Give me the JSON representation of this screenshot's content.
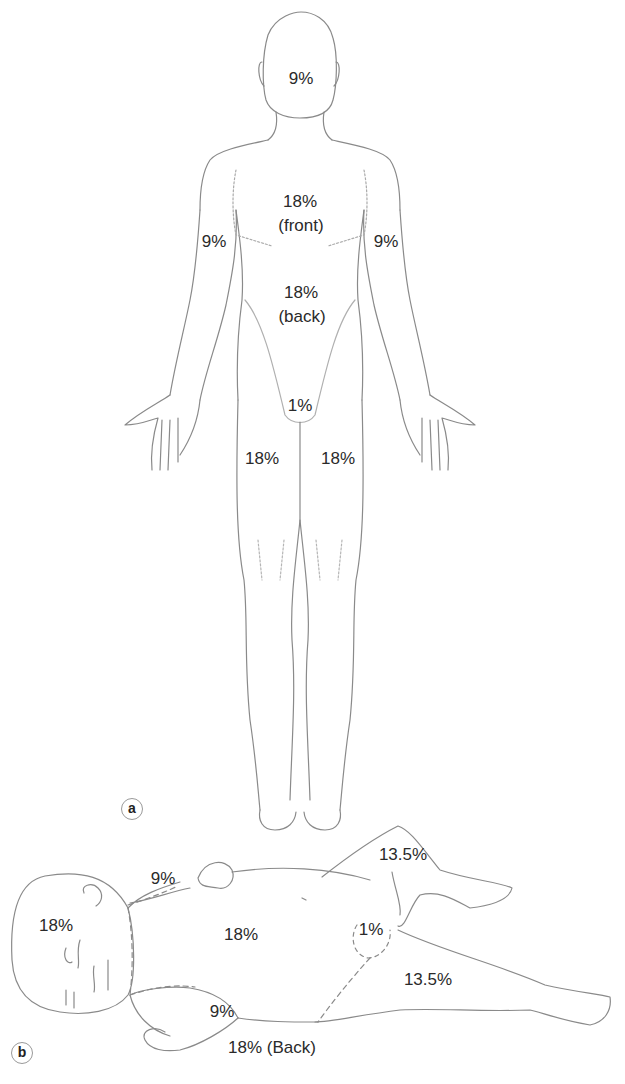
{
  "figure": {
    "panels": [
      {
        "id": "a",
        "tag": "a",
        "description": "Adult, front view",
        "labels": {
          "head": "9%",
          "trunk_front_pct": "18%",
          "trunk_front_note": "(front)",
          "arm_left": "9%",
          "arm_right": "9%",
          "trunk_back_pct": "18%",
          "trunk_back_note": "(back)",
          "perineum": "1%",
          "leg_left": "18%",
          "leg_right": "18%"
        }
      },
      {
        "id": "b",
        "tag": "b",
        "description": "Infant, lying on side",
        "labels": {
          "head": "18%",
          "arm_upper": "9%",
          "trunk_front": "18%",
          "perineum": "1%",
          "leg_upper": "13.5%",
          "leg_lower": "13.5%",
          "arm_lower": "9%",
          "trunk_back": "18% (Back)"
        }
      }
    ]
  },
  "colors": {
    "line": "#8a8a8a",
    "text": "#2a2a2a",
    "background": "#ffffff"
  }
}
